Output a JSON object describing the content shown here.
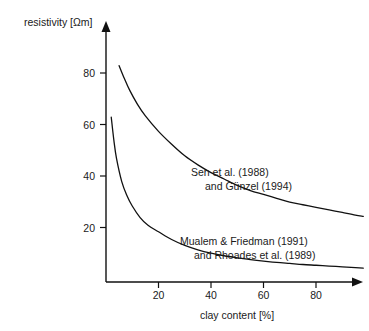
{
  "chart_data": {
    "type": "line",
    "title": "",
    "xlabel": "clay content [%]",
    "ylabel": "resistivity [Ωm]",
    "xlim": [
      0,
      98
    ],
    "ylim": [
      0,
      98
    ],
    "xticks": [
      20,
      40,
      60,
      80
    ],
    "yticks": [
      20,
      40,
      60,
      80
    ],
    "xtick_labels": [
      "20",
      "40",
      "60",
      "80"
    ],
    "ytick_labels": [
      "20",
      "40",
      "60",
      "80"
    ],
    "grid": false,
    "legend_position": "inline-annotations",
    "axis_style": "arrow-headed-left-and-bottom",
    "series": [
      {
        "name": "Sen et al. (1988) and Günzel (1994)",
        "x": [
          5,
          7,
          9,
          12,
          15,
          20,
          25,
          30,
          35,
          40,
          45,
          50,
          55,
          60,
          65,
          70,
          75,
          80,
          85,
          90,
          95,
          98
        ],
        "y": [
          84,
          79,
          74.5,
          69,
          64.5,
          58.5,
          53.5,
          49,
          45.5,
          42.5,
          40,
          37.5,
          35.5,
          34,
          32.5,
          31,
          30,
          29,
          28,
          27,
          26,
          25.5
        ]
      },
      {
        "name": "Mualem & Friedman (1991) and Rhoades et al. (1989)",
        "x": [
          2,
          3,
          4,
          6,
          8,
          10,
          13,
          16,
          20,
          25,
          30,
          35,
          40,
          45,
          50,
          55,
          60,
          65,
          70,
          75,
          80,
          85,
          90,
          95,
          98
        ],
        "y": [
          64,
          55,
          48,
          39,
          33.5,
          29.5,
          25,
          22,
          19.5,
          16.5,
          14.2,
          12.5,
          11.2,
          10.2,
          9.4,
          8.7,
          8.1,
          7.6,
          7.2,
          6.8,
          6.5,
          6.2,
          5.9,
          5.6,
          5.4
        ]
      }
    ],
    "annotations": [
      {
        "id": "annotation-sen",
        "lines": [
          "Sen et al. (1988)",
          "and Günzel (1994)"
        ],
        "x_px": 191,
        "y_px": 172
      },
      {
        "id": "annotation-mualem",
        "lines": [
          "Mualem & Friedman (1991)",
          "and Rhoades et al. (1989)"
        ],
        "x_px": 180,
        "y_px": 241
      }
    ]
  }
}
